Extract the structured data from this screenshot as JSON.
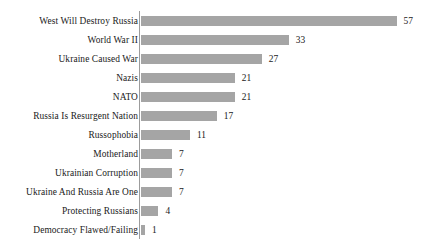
{
  "chart_data": {
    "type": "bar",
    "orientation": "horizontal",
    "title": "",
    "subtitle": "",
    "xlabel": "",
    "ylabel": "",
    "grid": false,
    "legend": false,
    "axis_line": true,
    "xlim": [
      0,
      57
    ],
    "bar_color": "#a5a5a5",
    "text_color": "#1a1a1a",
    "categories": [
      "West Will Destroy Russia",
      "World War II",
      "Ukraine Caused War",
      "Nazis",
      "NATO",
      "Russia Is Resurgent Nation",
      "Russophobia",
      "Motherland",
      "Ukrainian Corruption",
      "Ukraine And Russia Are One",
      "Protecting Russians",
      "Democracy Flawed/Failing"
    ],
    "values": [
      57,
      33,
      27,
      21,
      21,
      17,
      11,
      7,
      7,
      7,
      4,
      1
    ],
    "value_labels": [
      "57",
      "33",
      "27",
      "21",
      "21",
      "17",
      "11",
      "7",
      "7",
      "7",
      "4",
      "1"
    ]
  }
}
